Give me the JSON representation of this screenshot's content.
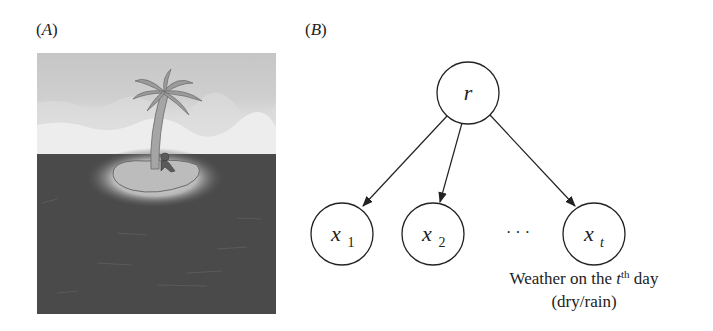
{
  "panels": {
    "a": {
      "label_open": "(",
      "label_letter": "A",
      "label_close": ")",
      "illustration": "desert-island-with-palm-tree-and-person",
      "colors": {
        "sky_top": "#c9c9c9",
        "sky_bottom": "#f0f0f0",
        "sea": "#4a4a4a",
        "island": "#bdbdbd",
        "glow": "#8a8a8a",
        "palm_leaf": "#9a9a9a",
        "trunk": "#a8a8a8"
      }
    },
    "b": {
      "label_open": "(",
      "label_letter": "B",
      "label_close": ")",
      "nodes": [
        {
          "id": "r",
          "main": "r",
          "sub": ""
        },
        {
          "id": "x1",
          "main": "x",
          "sub": "1"
        },
        {
          "id": "x2",
          "main": "x",
          "sub": "2"
        },
        {
          "id": "xt",
          "main": "x",
          "sub": "t"
        }
      ],
      "edges": [
        {
          "from": "r",
          "to": "x1"
        },
        {
          "from": "r",
          "to": "x2"
        },
        {
          "from": "r",
          "to": "xt"
        }
      ],
      "ellipsis": "· · ·",
      "caption": {
        "line1_prefix": "Weather on the ",
        "line1_var": "t",
        "line1_sup": "th",
        "line1_suffix": " day",
        "line2": "(dry/rain)"
      }
    }
  }
}
